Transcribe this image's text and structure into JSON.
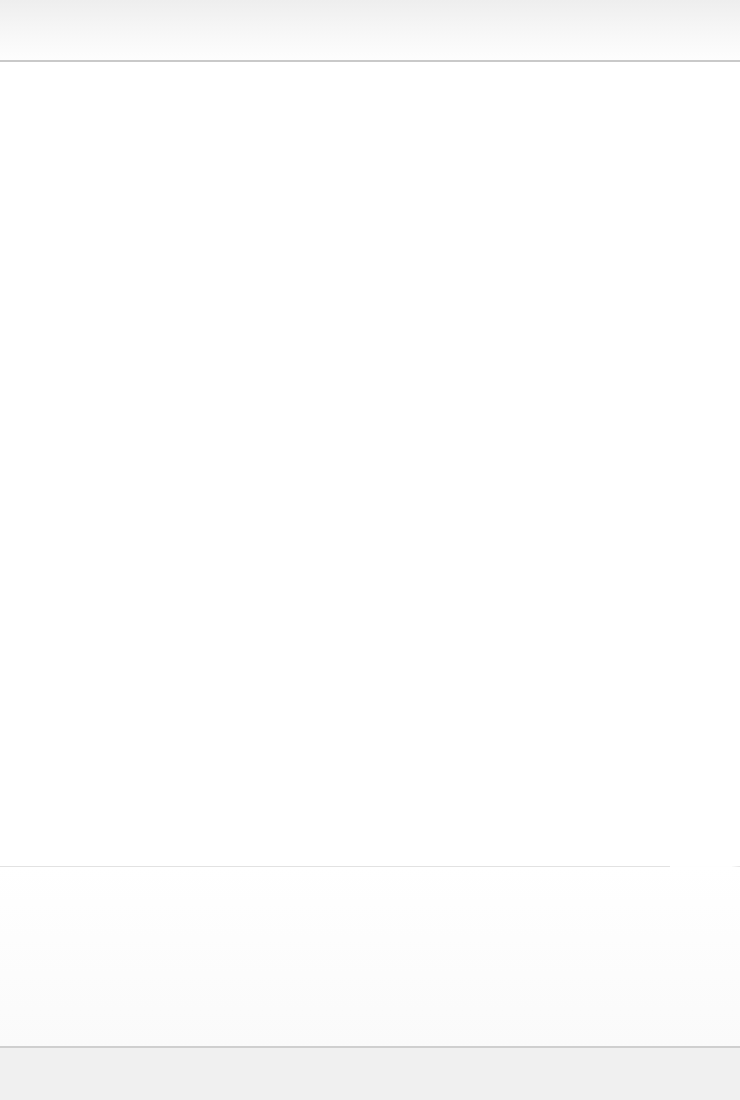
{
  "page": {
    "note": "",
    "background_color": "#ffffff"
  },
  "header": {
    "text": "",
    "background_color": "#f2f2f2",
    "rule_color": "#c9c9c9"
  },
  "body": {
    "text": ""
  },
  "lower_block": {
    "text": ""
  },
  "footer": {
    "text": "",
    "background_color": "#f0f0f0"
  }
}
